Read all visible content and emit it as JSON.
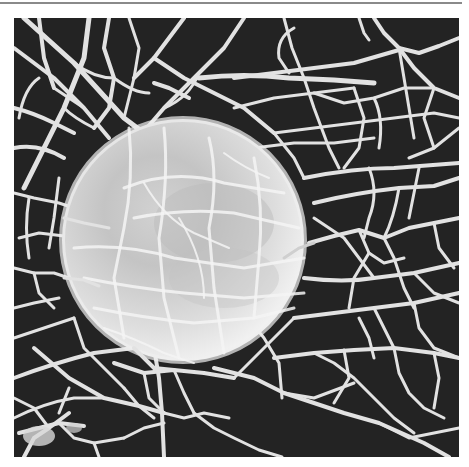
{
  "figure": {
    "kind": "grayscale scanning electron micrograph",
    "colors": {
      "background": "#232323",
      "fiber": "#e2e2e2",
      "sphere_highlight": "#f2f2f2",
      "sphere_shadow": "#a9a9a9",
      "top_rule": "#8a8a8a"
    },
    "sphere": {
      "cx": 169,
      "cy": 222,
      "r": 121
    }
  }
}
